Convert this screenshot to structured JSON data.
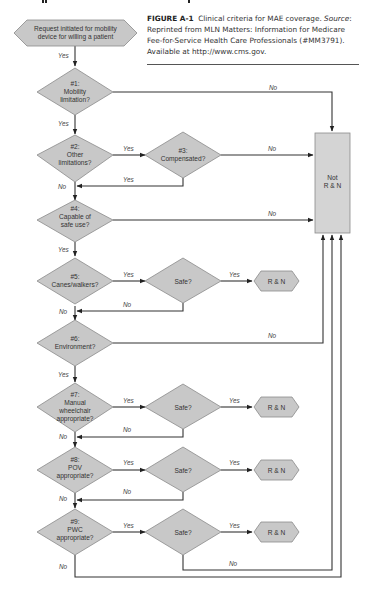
{
  "caption": {
    "figure_label": "FIGURE A-1",
    "title": "Clinical criteria for MAE coverage.",
    "source_label": "Source",
    "source_text": ": Reprinted from MLN Matters: Information for Medicare Fee-for-Service Health Care Professionals (#MM3791). Available at http://www.cms.gov."
  },
  "flow": {
    "start": {
      "line1": "Request initiated for mobility",
      "line2": "device for willing a patient"
    },
    "d1": {
      "line1": "#1:",
      "line2": "Mobility",
      "line3": "limitation?"
    },
    "d2": {
      "line1": "#2:",
      "line2": "Other",
      "line3": "limitations?"
    },
    "d3": {
      "line1": "#3:",
      "line2": "Compensated?"
    },
    "d4": {
      "line1": "#4:",
      "line2": "Capable of",
      "line3": "safe use?"
    },
    "d5": {
      "line1": "#5:",
      "line2": "Canes/walkers?"
    },
    "d6": {
      "line1": "#6:",
      "line2": "Environment?"
    },
    "d7": {
      "line1": "#7:",
      "line2": "Manual",
      "line3": "wheelchair",
      "line4": "appropriate?"
    },
    "d8": {
      "line1": "#8:",
      "line2": "POV",
      "line3": "appropriate?"
    },
    "d9": {
      "line1": "#9:",
      "line2": "PWC",
      "line3": "appropriate?"
    },
    "safe": "Safe?",
    "rn": "R & N",
    "not_rn": {
      "line1": "Not",
      "line2": "R & N"
    },
    "yes": "Yes",
    "no": "No"
  }
}
